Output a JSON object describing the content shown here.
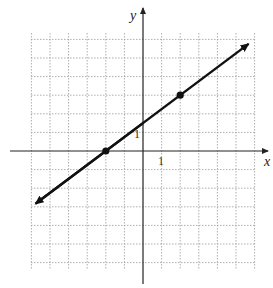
{
  "chart_data": {
    "type": "line",
    "title": "",
    "xlabel": "x",
    "ylabel": "y",
    "tick_labels": {
      "x": "1",
      "y": "1"
    },
    "grid": true,
    "xlim": [
      -6,
      6
    ],
    "ylim": [
      -6.5,
      6.3
    ],
    "line": {
      "slope": 0.75,
      "intercept": 1.5,
      "equation": "y = 3/4 x + 3/2",
      "arrows": "both"
    },
    "points": [
      {
        "x": -2,
        "y": 0
      },
      {
        "x": 2,
        "y": 3
      }
    ],
    "line_extent": {
      "from": {
        "x": -6,
        "y": -3
      },
      "to": {
        "x": 6,
        "y": 6
      }
    }
  },
  "labels": {
    "x_axis": "x",
    "y_axis": "y",
    "x_tick": "1",
    "y_tick": "1"
  }
}
